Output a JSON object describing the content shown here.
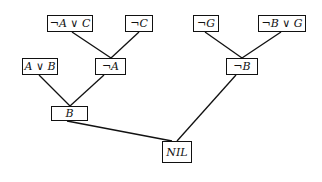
{
  "diagram": {
    "type": "resolution-refutation-tree",
    "nodes": [
      {
        "id": "n1",
        "label": "¬A ∨ C",
        "x": 47,
        "y": 15,
        "w": 46,
        "h": 17
      },
      {
        "id": "n2",
        "label": "¬C",
        "x": 125,
        "y": 15,
        "w": 28,
        "h": 17
      },
      {
        "id": "n3",
        "label": "¬G",
        "x": 193,
        "y": 15,
        "w": 26,
        "h": 17
      },
      {
        "id": "n4",
        "label": "¬B ∨ G",
        "x": 258,
        "y": 15,
        "w": 48,
        "h": 17
      },
      {
        "id": "n5",
        "label": "A ∨ B",
        "x": 22,
        "y": 58,
        "w": 36,
        "h": 17
      },
      {
        "id": "n6",
        "label": "¬A",
        "x": 95,
        "y": 58,
        "w": 31,
        "h": 17
      },
      {
        "id": "n7",
        "label": "¬B",
        "x": 226,
        "y": 58,
        "w": 32,
        "h": 17
      },
      {
        "id": "n8",
        "label": "B",
        "x": 51,
        "y": 106,
        "w": 37,
        "h": 15
      },
      {
        "id": "n9",
        "label": "NIL",
        "x": 162,
        "y": 141,
        "w": 30,
        "h": 22
      }
    ],
    "edges": [
      {
        "from": "n1",
        "to": "n6"
      },
      {
        "from": "n2",
        "to": "n6"
      },
      {
        "from": "n3",
        "to": "n7"
      },
      {
        "from": "n4",
        "to": "n7"
      },
      {
        "from": "n5",
        "to": "n8"
      },
      {
        "from": "n6",
        "to": "n8"
      },
      {
        "from": "n8",
        "to": "n9"
      },
      {
        "from": "n7",
        "to": "n9"
      }
    ]
  }
}
